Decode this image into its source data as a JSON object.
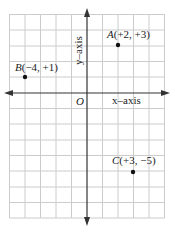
{
  "diagram": {
    "type": "coordinate-plane",
    "grid": {
      "x_min": -5,
      "x_max": 5,
      "y_min": -8,
      "y_max": 5,
      "spacing_px_x": 15.5,
      "spacing_px_y": 15.7
    },
    "colors": {
      "grid": "#cccccc",
      "axis": "#333333",
      "point": "#111111",
      "text": "#222222"
    },
    "axes": {
      "x_label": "x–axis",
      "y_label": "y–axis",
      "origin_label": "O"
    },
    "points": [
      {
        "name": "A",
        "coords": "(+2, +3)",
        "x": 2,
        "y": 3
      },
      {
        "name": "B",
        "coords": "(−4, +1)",
        "x": -4,
        "y": 1
      },
      {
        "name": "C",
        "coords": "(+3, −5)",
        "x": 3,
        "y": -5
      }
    ]
  }
}
